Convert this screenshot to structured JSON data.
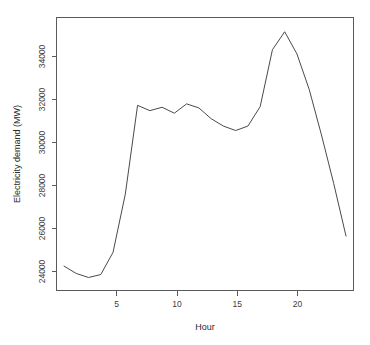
{
  "chart_data": {
    "type": "line",
    "title": "",
    "xlabel": "Hour",
    "ylabel": "Electricity demand (MW)",
    "x": [
      1,
      2,
      3,
      4,
      5,
      6,
      7,
      8,
      9,
      10,
      11,
      12,
      13,
      14,
      15,
      16,
      17,
      18,
      19,
      20,
      21,
      22,
      23,
      24
    ],
    "values": [
      24300,
      23950,
      23760,
      23900,
      24950,
      27700,
      31900,
      31650,
      31810,
      31530,
      31970,
      31780,
      31270,
      30920,
      30710,
      30920,
      31840,
      34530,
      35380,
      34330,
      32650,
      30500,
      28200,
      25720
    ],
    "series": [
      {
        "name": "Electricity demand",
        "values": [
          24300,
          23950,
          23760,
          23900,
          24950,
          27700,
          31900,
          31650,
          31810,
          31530,
          31970,
          31780,
          31270,
          30920,
          30710,
          30920,
          31840,
          34530,
          35380,
          34330,
          32650,
          30500,
          28200,
          25720
        ]
      }
    ],
    "xlim": [
      1,
      24
    ],
    "ylim": [
      23500,
      35700
    ],
    "xticks": [
      5,
      10,
      15,
      20
    ],
    "xtick_labels": [
      "5",
      "10",
      "15",
      "20"
    ],
    "yticks": [
      24000,
      26000,
      28000,
      30000,
      32000,
      34000
    ],
    "ytick_labels": [
      "24000",
      "26000",
      "28000",
      "30000",
      "32000",
      "34000"
    ],
    "grid": false,
    "legend": false,
    "legend_position": "none",
    "line_color": "#4a4a4a",
    "axis_color": "#5a5a5a",
    "background_color": "#ffffff"
  },
  "labels": {
    "x_axis_title": "Hour",
    "y_axis_title": "Electricity demand (MW)",
    "y_tick_0": "24000",
    "y_tick_1": "26000",
    "y_tick_2": "28000",
    "y_tick_3": "30000",
    "y_tick_4": "32000",
    "y_tick_5": "34000",
    "x_tick_0": "5",
    "x_tick_1": "10",
    "x_tick_2": "15",
    "x_tick_3": "20"
  }
}
